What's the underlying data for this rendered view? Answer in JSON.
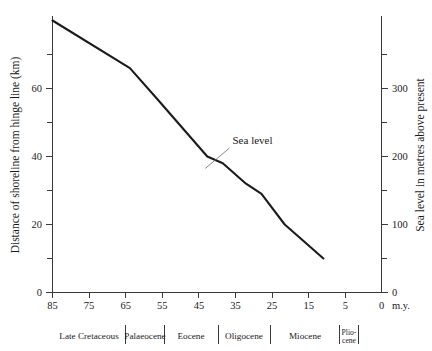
{
  "chart_data": {
    "type": "line",
    "title": "",
    "xlabel": "m.y.",
    "ylabel": "Distance of shoreline from hinge line (km)",
    "y2label": "Sea level in metres above present",
    "xlim": [
      85,
      0
    ],
    "ylim": [
      0,
      81
    ],
    "y2lim": [
      0,
      476
    ],
    "grid": false,
    "legend": "none",
    "x_ticks_major": [
      85,
      75,
      65,
      55,
      45,
      35,
      25,
      15,
      5,
      0
    ],
    "x_tick_labels": [
      "85",
      "75",
      "65",
      "55",
      "45",
      "35",
      "25",
      "15",
      "5",
      "0"
    ],
    "x_ticks_minor": [
      80,
      70,
      60,
      50,
      40,
      30,
      20,
      10
    ],
    "y_ticks_major": [
      0,
      20,
      40,
      60
    ],
    "y_tick_labels": [
      "0",
      "20",
      "40",
      "60"
    ],
    "y_ticks_minor": [
      10,
      30,
      50,
      70
    ],
    "y2_ticks_major": [
      0,
      100,
      200,
      300
    ],
    "y2_tick_labels": [
      "0",
      "100",
      "200",
      "300"
    ],
    "y2_ticks_minor": [
      50,
      150,
      250,
      350
    ],
    "series": [
      {
        "name": "Sea level",
        "x": [
          85,
          65,
          58,
          45,
          41,
          35,
          31,
          25,
          20,
          15
        ],
        "values": [
          80,
          66,
          57,
          40,
          38,
          32,
          29,
          20,
          15,
          10
        ],
        "sea_level_m": [
          392,
          323,
          279,
          196,
          186,
          157,
          142,
          98,
          74,
          49
        ]
      }
    ],
    "annotations": [
      {
        "text": "Sea level",
        "x_label": 38.5,
        "y_label": 42.5,
        "x_point": 45.5,
        "y_point": 36.5
      }
    ],
    "epochs": [
      {
        "label": "Late Cretaceous",
        "start": 85,
        "end": 65
      },
      {
        "label": "Palaeocene",
        "start": 65,
        "end": 54.5
      },
      {
        "label": "Eocene",
        "start": 54.5,
        "end": 39.5
      },
      {
        "label": "Oligocene",
        "start": 39.5,
        "end": 25.5
      },
      {
        "label": "Miocene",
        "start": 25.5,
        "end": 6.5
      },
      {
        "label": "Plio-cene",
        "label_line1": "Plio-",
        "label_line2": "cene",
        "start": 6.5,
        "end": 1.5
      }
    ],
    "colors": {
      "series": "#1b1b1b",
      "axis": "#3a3a3a",
      "text": "#1a1a1a",
      "background": "#ffffff",
      "leader": "#6b6b6b"
    }
  }
}
